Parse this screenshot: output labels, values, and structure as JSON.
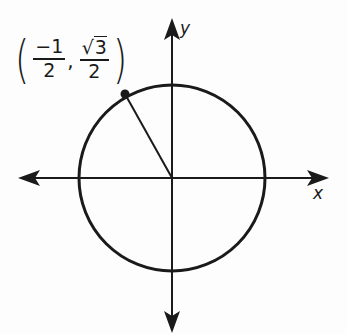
{
  "diagram": {
    "type": "unit-circle",
    "axes": {
      "x_label": "x",
      "y_label": "y"
    },
    "point": {
      "label_open": "(",
      "label_close": ")",
      "x_num": "−1",
      "x_den": "2",
      "y_num_radical": "√",
      "y_num_value": "3",
      "y_den": "2",
      "separator": ","
    },
    "colors": {
      "stroke": "#1a1a1a",
      "background": "#fdfdfd"
    },
    "geometry": {
      "center": [
        172,
        178
      ],
      "radius": 93,
      "point_px": [
        125,
        94
      ],
      "x_axis_range_px": [
        18,
        328
      ],
      "y_axis_range_px": [
        18,
        332
      ]
    }
  }
}
